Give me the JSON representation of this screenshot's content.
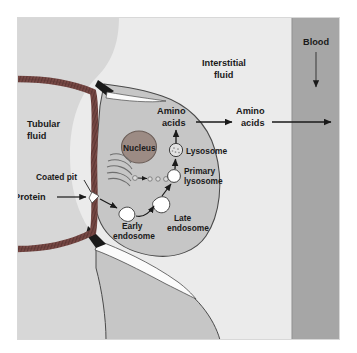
{
  "figure": {
    "colors": {
      "page_background": "#ffffff",
      "frame_border": "#d8d8d8",
      "tubular_fluid": "#d7d7d7",
      "interstitial_fluid": "#ebebeb",
      "cell_cytoplasm": "#c6c6c6",
      "blood": "#a6a6a6",
      "brush_border_membrane": "#7a4a46",
      "nucleus_fill": "#9c8b84",
      "nucleus_outline": "#6b5d57",
      "cell_outline": "#4a4a4a",
      "arrow": "#1a1a1a",
      "vesicle_fill": "#ffffff",
      "lysosome_fill": "#e2e2e2",
      "label_text": "#1a1a1a"
    }
  },
  "regions": {
    "tubular_fluid": {
      "label_line1": "Tubular",
      "label_line2": "fluid"
    },
    "interstitial_fluid": {
      "label_line1": "Interstitial",
      "label_line2": "fluid"
    },
    "blood": {
      "label": "Blood",
      "flow_arrow": "down-arrow"
    }
  },
  "structures": {
    "coated_pit": {
      "label": "Coated pit"
    },
    "protein": {
      "label": "Protein"
    },
    "nucleus": {
      "label": "Nucleus"
    },
    "golgi": {
      "label": "",
      "cisternae_count": 5
    },
    "early_endosome": {
      "label_line1": "Early",
      "label_line2": "endosome"
    },
    "late_endosome": {
      "label_line1": "Late",
      "label_line2": "endosome"
    },
    "primary_lysosome": {
      "label_line1": "Primary",
      "label_line2": "lysosome"
    },
    "lysosome": {
      "label": "Lysosome"
    },
    "amino_acids_cell": {
      "label_line1": "Amino",
      "label_line2": "acids"
    },
    "amino_acids_interstitial": {
      "label_line1": "Amino",
      "label_line2": "acids"
    }
  },
  "pathway": {
    "steps": [
      "Protein",
      "Coated pit",
      "Early endosome",
      "Late endosome",
      "Primary lysosome",
      "Lysosome",
      "Amino acids",
      "Amino acids",
      "Blood"
    ]
  }
}
